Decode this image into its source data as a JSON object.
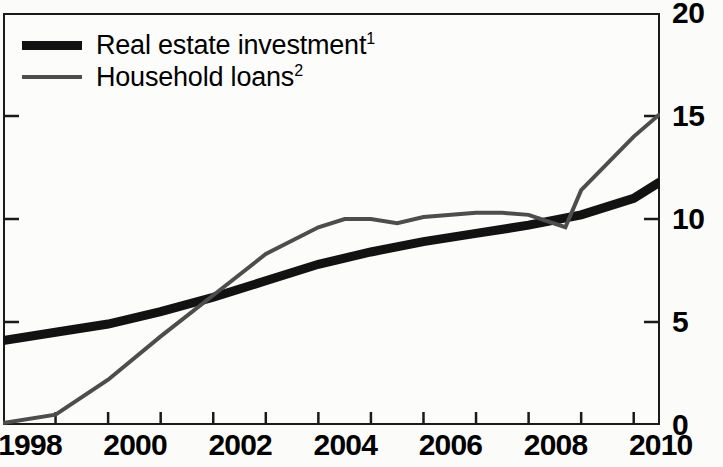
{
  "chart_data": {
    "type": "line",
    "title": "",
    "subtitle": "",
    "xlabel": "",
    "ylabel": "",
    "xlim": [
      1998,
      2010.5
    ],
    "ylim": [
      0,
      20
    ],
    "y_axis_position": "right",
    "grid": false,
    "legend_position": "top-left",
    "yticks": [
      0,
      5,
      10,
      15,
      20
    ],
    "ytick_labels": [
      "0",
      "5",
      "10",
      "15",
      "20"
    ],
    "xticks": [
      1998,
      1999,
      2000,
      2001,
      2002,
      2003,
      2004,
      2005,
      2006,
      2007,
      2008,
      2009,
      2010
    ],
    "xtick_labels": [
      "1998",
      "2000",
      "2002",
      "2004",
      "2006",
      "2008",
      "2010"
    ],
    "xtick_label_values": [
      1998,
      2000,
      2002,
      2004,
      2006,
      2008,
      2010
    ],
    "series": [
      {
        "name": "Real estate investment",
        "footnote": "1",
        "color": "#121212",
        "width": 9,
        "x": [
          1998,
          1999,
          2000,
          2001,
          2002,
          2003,
          2004,
          2005,
          2006,
          2007,
          2008,
          2009,
          2010,
          2010.5
        ],
        "values": [
          4.1,
          4.5,
          4.9,
          5.5,
          6.2,
          7.0,
          7.8,
          8.4,
          8.9,
          9.3,
          9.7,
          10.2,
          11.0,
          11.8
        ]
      },
      {
        "name": "Household loans",
        "footnote": "2",
        "color": "#4d4d4d",
        "width": 4,
        "x": [
          1998,
          1999,
          2000,
          2001,
          2002,
          2003,
          2004,
          2004.5,
          2005,
          2005.5,
          2006,
          2007,
          2007.5,
          2008,
          2008.7,
          2009,
          2010,
          2010.5
        ],
        "values": [
          0.1,
          0.5,
          2.2,
          4.3,
          6.3,
          8.3,
          9.6,
          10.0,
          10.0,
          9.8,
          10.1,
          10.3,
          10.3,
          10.2,
          9.6,
          11.4,
          14.0,
          15.1
        ]
      }
    ]
  },
  "legend": {
    "items": [
      {
        "label": "Real estate investment",
        "footnote": "1",
        "style": "thick"
      },
      {
        "label": "Household loans",
        "footnote": "2",
        "style": "thin"
      }
    ]
  },
  "colors": {
    "real_estate_investment": "#121212",
    "household_loans": "#4d4d4d",
    "axis": "#1a1a1a",
    "background": "#fcfcfb"
  }
}
